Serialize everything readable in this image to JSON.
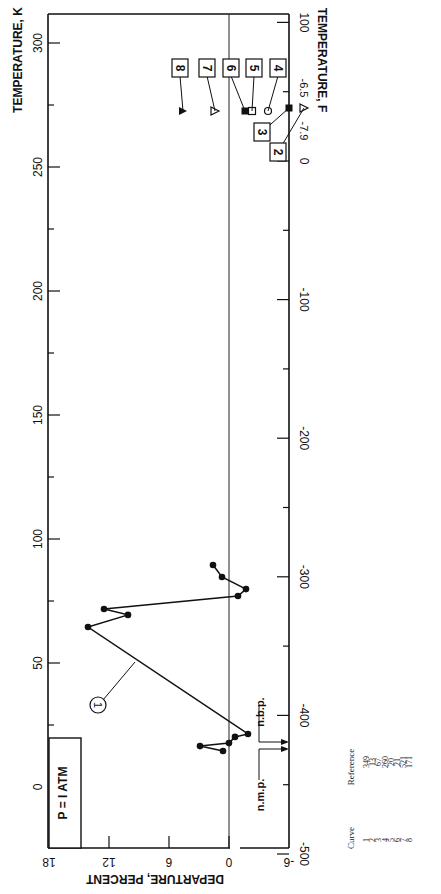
{
  "chart_data": {
    "type": "scatter",
    "orientation": "rotated 90deg (page printed sideways)",
    "title": "",
    "xlabel": "TEMPERATURE, K",
    "x2label": "TEMPERATURE, F",
    "ylabel": "DEPARTURE, PERCENT",
    "xlim": [
      0,
      300
    ],
    "ylim": [
      -6,
      18
    ],
    "x_ticks_K": [
      0,
      50,
      100,
      150,
      200,
      250,
      300
    ],
    "x_ticks_F": [
      -500,
      -400,
      -300,
      -200,
      -100,
      0,
      100
    ],
    "y_ticks": [
      18,
      12,
      6,
      0,
      -6
    ],
    "grid": false,
    "zero_line": true,
    "annotations": {
      "pressure_box": "P = I ATM",
      "nbp": "n.b.p.",
      "nmp": "n.m.p.",
      "offscale_labels": [
        "-6.5",
        "-7.9"
      ]
    },
    "series": [
      {
        "name": "1",
        "marker": "filled-circle",
        "connected": true,
        "points": [
          [
            14.5,
            0.6
          ],
          [
            16.5,
            2.9
          ],
          [
            17.7,
            0.0
          ],
          [
            20.2,
            -0.6
          ],
          [
            21.4,
            -1.9
          ],
          [
            64.5,
            14.1
          ],
          [
            69.4,
            10.1
          ],
          [
            71.8,
            12.5
          ],
          [
            77.0,
            -0.9
          ],
          [
            79.8,
            -1.7
          ],
          [
            84.7,
            0.7
          ],
          [
            89.5,
            1.6
          ]
        ]
      },
      {
        "name": "2",
        "marker": "open-triangle",
        "connected": false,
        "points": [
          [
            273,
            -7.9
          ]
        ]
      },
      {
        "name": "3",
        "marker": "filled-square",
        "connected": false,
        "points": [
          [
            273,
            -6.5
          ]
        ]
      },
      {
        "name": "4",
        "marker": "open-circle",
        "connected": false,
        "points": [
          [
            273,
            -3.9
          ]
        ]
      },
      {
        "name": "5",
        "marker": "open-square",
        "connected": false,
        "points": [
          [
            273,
            -2.3
          ]
        ]
      },
      {
        "name": "6",
        "marker": "filled-square",
        "connected": false,
        "points": [
          [
            273,
            -1.6
          ]
        ]
      },
      {
        "name": "7",
        "marker": "open-triangle",
        "connected": false,
        "points": [
          [
            273,
            1.4
          ]
        ]
      },
      {
        "name": "8",
        "marker": "filled-triangle",
        "connected": false,
        "points": [
          [
            273,
            4.6
          ]
        ]
      }
    ],
    "reference_table": {
      "headers": [
        "Curve",
        "Reference"
      ],
      "rows": [
        [
          "1",
          "349"
        ],
        [
          "2",
          "13"
        ],
        [
          "3",
          "67"
        ],
        [
          "4",
          "260"
        ],
        [
          "5",
          "20"
        ],
        [
          "6",
          "21"
        ],
        [
          "7",
          "521"
        ],
        [
          "8",
          "171"
        ]
      ]
    }
  },
  "labels": {
    "k_axis": "TEMPERATURE, K",
    "f_axis": "TEMPERATURE, F",
    "dep_axis": "DEPARTURE, PERCENT",
    "pressure": "P = I ATM",
    "nbp": "n.b.p.",
    "nmp": "n.m.p.",
    "v65": "-6.5",
    "v79": "-7.9",
    "curve_hdr": "Curve",
    "ref_hdr": "Reference"
  }
}
